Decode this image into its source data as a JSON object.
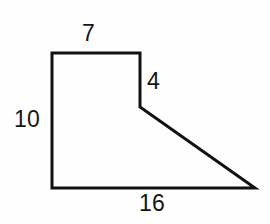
{
  "figure": {
    "name": "dimensioned-polygon",
    "stroke_color": "#111111",
    "stroke_width": 3,
    "fill_color": "none",
    "background_color": "#fefefe",
    "vertices": [
      {
        "name": "top-left",
        "x": 52,
        "y": 53
      },
      {
        "name": "top-right",
        "x": 140,
        "y": 53
      },
      {
        "name": "notch-bottom",
        "x": 140,
        "y": 107
      },
      {
        "name": "right-apex",
        "x": 255,
        "y": 188
      },
      {
        "name": "bottom-left",
        "x": 52,
        "y": 188
      }
    ],
    "path": "M 52 53 L 140 53 L 140 107 L 255 188 L 52 188 Z"
  },
  "labels": {
    "top": "7",
    "left": "10",
    "notch": "4",
    "bottom": "16"
  },
  "chart_data": {
    "type": "diagram",
    "title": "",
    "shape": "irregular pentagon",
    "edges": [
      {
        "name": "top-edge",
        "label": "7",
        "value": 7,
        "orientation": "horizontal",
        "from": "top-left",
        "to": "top-right"
      },
      {
        "name": "notch-edge",
        "label": "4",
        "value": 4,
        "orientation": "vertical",
        "from": "top-right",
        "to": "notch-bottom"
      },
      {
        "name": "slant-edge",
        "label": "",
        "value": null,
        "orientation": "diagonal",
        "from": "notch-bottom",
        "to": "right-apex"
      },
      {
        "name": "bottom-edge",
        "label": "16",
        "value": 16,
        "orientation": "horizontal",
        "from": "right-apex",
        "to": "bottom-left"
      },
      {
        "name": "left-edge",
        "label": "10",
        "value": 10,
        "orientation": "vertical",
        "from": "bottom-left",
        "to": "top-left"
      }
    ]
  }
}
